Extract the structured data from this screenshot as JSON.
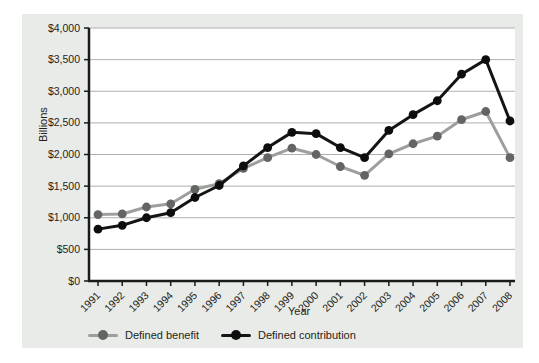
{
  "colors": {
    "page_bg": "#ffffff",
    "panel_bg": "#e9ebe8",
    "plot_bg": "#ffffff",
    "grid": "#adb0ad",
    "axis": "#1a1a1a",
    "text": "#231f20",
    "benefit_line": "#9d9f9d",
    "benefit_marker": "#636563",
    "contribution_line": "#141414",
    "contribution_marker": "#0d0d0d"
  },
  "chart_data": {
    "type": "line",
    "title": "",
    "xlabel": "Year",
    "ylabel": "Billions",
    "x": [
      "1991",
      "1992",
      "1993",
      "1994",
      "1995",
      "1996",
      "1997",
      "1998",
      "1999",
      "2000",
      "2001",
      "2002",
      "2003",
      "2004",
      "2005",
      "2006",
      "2007",
      "2008"
    ],
    "series": [
      {
        "name": "Defined benefit",
        "values": [
          1050,
          1060,
          1170,
          1220,
          1450,
          1540,
          1780,
          1950,
          2100,
          2000,
          1810,
          1670,
          2010,
          2170,
          2290,
          2550,
          2680,
          1950
        ]
      },
      {
        "name": "Defined contribution",
        "values": [
          820,
          880,
          1000,
          1080,
          1320,
          1510,
          1820,
          2110,
          2350,
          2330,
          2110,
          1950,
          2380,
          2630,
          2850,
          3270,
          3500,
          2530
        ]
      }
    ],
    "ylim": [
      0,
      4000
    ],
    "ytick_step": 500,
    "ytick_labels": [
      "$0",
      "$500",
      "$1,000",
      "$1,500",
      "$2,000",
      "$2,500",
      "$3,000",
      "$3,500",
      "$4,000"
    ],
    "grid": true,
    "legend_position": "bottom-left"
  }
}
